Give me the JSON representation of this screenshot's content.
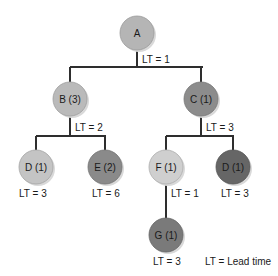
{
  "diagram": {
    "type": "product-structure-tree",
    "nodes": [
      {
        "id": "A",
        "label": "A",
        "cx": 137,
        "cy": 33,
        "fill": "#b5b5b5",
        "lt_label": "LT = 1",
        "lt_x": 142,
        "lt_y": 60
      },
      {
        "id": "B",
        "label": "B (3)",
        "cx": 70,
        "cy": 99,
        "fill": "#bababa",
        "lt_label": "LT = 2",
        "lt_x": 75,
        "lt_y": 128
      },
      {
        "id": "C",
        "label": "C (1)",
        "cx": 201,
        "cy": 99,
        "fill": "#8c8c8c",
        "lt_label": "LT = 3",
        "lt_x": 206,
        "lt_y": 128
      },
      {
        "id": "D1",
        "label": "D (1)",
        "cx": 36,
        "cy": 167,
        "fill": "#c4c4c4",
        "lt_label": "LT = 3",
        "lt_x": 19,
        "lt_y": 194
      },
      {
        "id": "E",
        "label": "E (2)",
        "cx": 105,
        "cy": 167,
        "fill": "#8a8a8a",
        "lt_label": "LT = 6",
        "lt_x": 92,
        "lt_y": 194
      },
      {
        "id": "F",
        "label": "F (1)",
        "cx": 166,
        "cy": 167,
        "fill": "#cfcfcf",
        "lt_label": "LT = 1",
        "lt_x": 171,
        "lt_y": 194
      },
      {
        "id": "D2",
        "label": "D (1)",
        "cx": 233,
        "cy": 167,
        "fill": "#666666",
        "lt_label": "LT = 3",
        "lt_x": 221,
        "lt_y": 194
      },
      {
        "id": "G",
        "label": "G (1)",
        "cx": 166,
        "cy": 235,
        "fill": "#7a7a7a",
        "lt_label": "LT = 3",
        "lt_x": 153,
        "lt_y": 262
      }
    ],
    "legend": {
      "text": "LT = Lead time",
      "x": 205,
      "y": 262
    },
    "colors": {
      "edge": "#2e2e2e",
      "text": "#1a1a1a",
      "background": "#ffffff",
      "shadow": "#d9d9d9"
    }
  }
}
